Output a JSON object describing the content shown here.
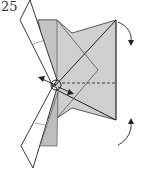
{
  "diagram": {
    "step_number": "25",
    "colors": {
      "paper_gray": "#c8c8c8",
      "paper_light": "#d4d4d4",
      "paper_white": "#ffffff",
      "line": "#2a2a2a"
    }
  }
}
